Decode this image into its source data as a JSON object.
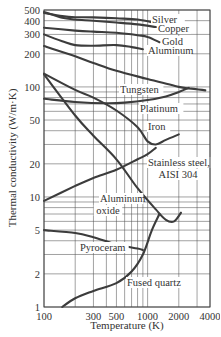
{
  "chart_data": {
    "type": "line",
    "title": "",
    "xlabel": "Temperature (K)",
    "ylabel": "Thermal conductivity (W/m·K)",
    "xscale": "log",
    "yscale": "log",
    "xlim": [
      100,
      4000
    ],
    "ylim": [
      1,
      500
    ],
    "grid": true,
    "legend_position": "inline labels",
    "x_ticks": [
      100,
      300,
      500,
      1000,
      2000,
      4000
    ],
    "x_tick_labels": [
      "100",
      "300",
      "500",
      "1000",
      "2000",
      "4000"
    ],
    "y_ticks": [
      1,
      2,
      5,
      10,
      20,
      50,
      100,
      200,
      300,
      400,
      500
    ],
    "y_tick_labels": [
      "1",
      "2",
      "5",
      "10",
      "20",
      "50",
      "100",
      "200",
      "300",
      "400",
      "500"
    ],
    "series": [
      {
        "name": "Silver",
        "label_at": [
          152,
          23
        ],
        "points": [
          [
            100,
            470
          ],
          [
            150,
            440
          ],
          [
            200,
            430
          ],
          [
            300,
            428
          ],
          [
            500,
            420
          ],
          [
            800,
            410
          ],
          [
            1200,
            380
          ]
        ]
      },
      {
        "name": "Copper",
        "label_at": [
          158,
          32
        ],
        "points": [
          [
            100,
            480
          ],
          [
            150,
            425
          ],
          [
            200,
            410
          ],
          [
            300,
            400
          ],
          [
            500,
            385
          ],
          [
            800,
            370
          ],
          [
            1200,
            350
          ]
        ]
      },
      {
        "name": "Gold",
        "label_at": [
          162,
          45
        ],
        "points": [
          [
            100,
            345
          ],
          [
            200,
            325
          ],
          [
            300,
            318
          ],
          [
            500,
            310
          ],
          [
            800,
            295
          ],
          [
            1000,
            285
          ],
          [
            1300,
            255
          ]
        ]
      },
      {
        "name": "Aluminum",
        "label_at": [
          148,
          54
        ],
        "points": [
          [
            100,
            300
          ],
          [
            150,
            260
          ],
          [
            200,
            240
          ],
          [
            300,
            237
          ],
          [
            500,
            240
          ],
          [
            700,
            230
          ],
          [
            900,
            220
          ]
        ]
      },
      {
        "name": "Tungsten",
        "label_at": [
          120,
          93
        ],
        "points": [
          [
            100,
            235
          ],
          [
            200,
            190
          ],
          [
            300,
            165
          ],
          [
            500,
            140
          ],
          [
            1000,
            118
          ],
          [
            2000,
            100
          ],
          [
            2500,
            97
          ],
          [
            3600,
            93
          ]
        ]
      },
      {
        "name": "Platinum",
        "label_at": [
          140,
          112
        ],
        "points": [
          [
            100,
            78
          ],
          [
            200,
            73
          ],
          [
            400,
            71
          ],
          [
            600,
            72
          ],
          [
            1000,
            76
          ],
          [
            1500,
            82
          ],
          [
            2000,
            90
          ],
          [
            2500,
            98
          ]
        ]
      },
      {
        "name": "Iron",
        "label_at": [
          148,
          130
        ],
        "points": [
          [
            100,
            132
          ],
          [
            200,
            94
          ],
          [
            300,
            80
          ],
          [
            500,
            61
          ],
          [
            800,
            43
          ],
          [
            1000,
            32
          ],
          [
            1200,
            30
          ],
          [
            1500,
            33
          ],
          [
            2000,
            37
          ]
        ]
      },
      {
        "name": "Stainless steel, AISI 304",
        "label_at": [
          148,
          166
        ],
        "points": [
          [
            100,
            9.2
          ],
          [
            200,
            12.6
          ],
          [
            300,
            14.9
          ],
          [
            500,
            17.7
          ],
          [
            800,
            22.0
          ],
          [
            1000,
            24.5
          ],
          [
            1200,
            28.0
          ]
        ]
      },
      {
        "name": "Aluminum oxide",
        "label_at": [
          100,
          202
        ],
        "points": [
          [
            100,
            130
          ],
          [
            200,
            55
          ],
          [
            300,
            36
          ],
          [
            500,
            22
          ],
          [
            800,
            12
          ],
          [
            1200,
            7.7
          ],
          [
            1500,
            6.2
          ],
          [
            1800,
            6.0
          ],
          [
            2100,
            7.2
          ]
        ]
      },
      {
        "name": "Pyroceram",
        "label_at": [
          80,
          251
        ],
        "points": [
          [
            100,
            5.0
          ],
          [
            200,
            4.7
          ],
          [
            300,
            4.3
          ],
          [
            500,
            3.7
          ],
          [
            800,
            3.4
          ],
          [
            900,
            3.3
          ]
        ]
      },
      {
        "name": "Fused quartz",
        "label_at": [
          127,
          286
        ],
        "points": [
          [
            150,
            1.0
          ],
          [
            200,
            1.2
          ],
          [
            300,
            1.4
          ],
          [
            500,
            1.65
          ],
          [
            700,
            2.1
          ],
          [
            900,
            3.0
          ],
          [
            1100,
            5.0
          ],
          [
            1300,
            7.0
          ]
        ]
      }
    ]
  },
  "labels": {
    "xlabel": "Temperature (K)",
    "ylabel": "Thermal conductivity (W/m·K)"
  }
}
